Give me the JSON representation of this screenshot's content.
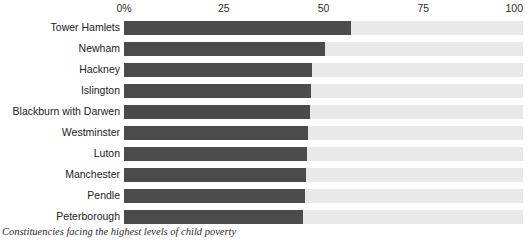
{
  "chart_data": {
    "type": "bar",
    "orientation": "horizontal",
    "title": "",
    "caption": "Constituencies facing the highest levels of child poverty",
    "xlabel": "",
    "ylabel": "",
    "xlim": [
      0,
      100
    ],
    "grid": false,
    "legend": null,
    "axis_ticks": [
      {
        "label": "0%",
        "value": 0
      },
      {
        "label": "25",
        "value": 25
      },
      {
        "label": "50",
        "value": 50
      },
      {
        "label": "75",
        "value": 75
      },
      {
        "label": "100",
        "value": 100
      }
    ],
    "categories": [
      "Tower Hamlets",
      "Newham",
      "Hackney",
      "Islington",
      "Blackburn with Darwen",
      "Westminster",
      "Luton",
      "Manchester",
      "Pendle",
      "Peterborough"
    ],
    "values": [
      57,
      50.4,
      47.1,
      46.8,
      46.6,
      46.1,
      45.9,
      45.6,
      45.4,
      44.9
    ],
    "colors": {
      "bar": "#4b4b4b",
      "track": "#e9e9e9",
      "text": "#222222",
      "background": "#ffffff"
    }
  }
}
